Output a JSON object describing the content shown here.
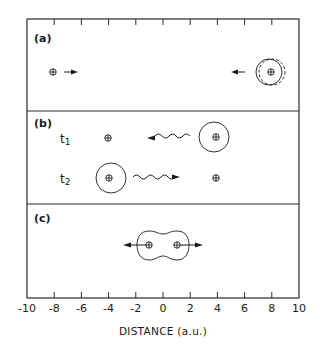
{
  "figure": {
    "xlabel": "DISTANCE (a.u.)",
    "panels": [
      {
        "id": "a",
        "label": "(a)"
      },
      {
        "id": "b",
        "label": "(b)",
        "time_labels": [
          "t1",
          "t2"
        ]
      },
      {
        "id": "c",
        "label": "(c)"
      }
    ],
    "x_ticks": [
      "-10",
      "-8",
      "-6",
      "-4",
      "-2",
      "0",
      "2",
      "4",
      "6",
      "8",
      "10"
    ]
  },
  "chart_data": {
    "type": "diagram",
    "title": "",
    "xlabel": "DISTANCE (a.u.)",
    "xlim": [
      -10,
      10
    ],
    "x_ticks": [
      -10,
      -8,
      -6,
      -4,
      -2,
      0,
      2,
      4,
      6,
      8,
      10
    ],
    "panels": [
      {
        "label": "(a)",
        "description": "Bare nucleus at x=-8 moving right toward nucleus with electron cloud at x=8 (cloud shown solid and dashed, slightly polarized); arrows point toward each other",
        "nuclei": [
          {
            "x": -8,
            "cloud": false
          },
          {
            "x": 8,
            "cloud": true,
            "cloud_dashed": true
          }
        ],
        "arrows": [
          {
            "from": -7.2,
            "to": -6.2,
            "direction": "right"
          },
          {
            "from": 6.0,
            "to": 5.0,
            "direction": "left"
          }
        ]
      },
      {
        "label": "(b)",
        "rows": [
          {
            "time": "t1",
            "nuclei": [
              {
                "x": -4,
                "cloud": false
              },
              {
                "x": 4,
                "cloud": true
              }
            ],
            "wavy_arrow": {
              "from": 2.0,
              "to": -1.0,
              "direction": "left"
            }
          },
          {
            "time": "t2",
            "nuclei": [
              {
                "x": -4,
                "cloud": true
              },
              {
                "x": 4,
                "cloud": false
              }
            ],
            "wavy_arrow": {
              "from": -2.3,
              "to": 1.0,
              "direction": "right"
            }
          }
        ]
      },
      {
        "label": "(c)",
        "description": "Two nuclei at x=-1 and x=+1 sharing a dumbbell-shaped (molecular) electron cloud, arrows pointing outward",
        "nuclei": [
          {
            "x": -1
          },
          {
            "x": 1
          }
        ],
        "shared_cloud": true,
        "arrows": [
          {
            "from": -1,
            "to": -2.8,
            "direction": "left"
          },
          {
            "from": 1,
            "to": 2.8,
            "direction": "right"
          }
        ]
      }
    ]
  }
}
